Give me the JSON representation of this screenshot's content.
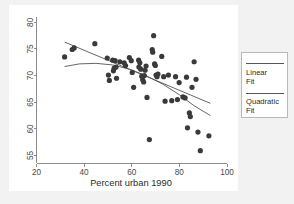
{
  "chart_data": {
    "type": "scatter",
    "title": "",
    "xlabel": "Percent urban 1990",
    "ylabel": "",
    "xlim": [
      20,
      100
    ],
    "ylim": [
      53.5,
      81
    ],
    "xticks": [
      20,
      40,
      60,
      80,
      100
    ],
    "yticks": [
      55,
      60,
      65,
      70,
      75,
      80
    ],
    "grid": false,
    "legend_position": "right-outside",
    "series": [
      {
        "name": "Data points",
        "type": "scatter",
        "marker": "filled-circle",
        "color": "#3a3a3a",
        "points": [
          [
            31.8,
            73.5
          ],
          [
            35.0,
            74.9
          ],
          [
            35.8,
            75.2
          ],
          [
            44.5,
            76.0
          ],
          [
            49.7,
            73.3
          ],
          [
            50.2,
            70.1
          ],
          [
            50.6,
            69.1
          ],
          [
            52.0,
            72.9
          ],
          [
            52.3,
            70.9
          ],
          [
            52.6,
            71.4
          ],
          [
            53.0,
            72.8
          ],
          [
            53.4,
            71.6
          ],
          [
            53.6,
            69.5
          ],
          [
            55.0,
            72.6
          ],
          [
            56.8,
            72.4
          ],
          [
            57.4,
            71.9
          ],
          [
            59.0,
            73.4
          ],
          [
            59.8,
            72.8
          ],
          [
            60.2,
            70.6
          ],
          [
            60.8,
            67.8
          ],
          [
            62.9,
            72.9
          ],
          [
            63.0,
            71.6
          ],
          [
            63.4,
            72.4
          ],
          [
            63.8,
            71.2
          ],
          [
            64.2,
            69.9
          ],
          [
            64.6,
            69.2
          ],
          [
            65.0,
            68.8
          ],
          [
            65.3,
            70.0
          ],
          [
            65.6,
            71.0
          ],
          [
            66.0,
            71.8
          ],
          [
            66.4,
            65.9
          ],
          [
            67.4,
            58.0
          ],
          [
            68.6,
            74.9
          ],
          [
            68.8,
            74.4
          ],
          [
            69.2,
            77.5
          ],
          [
            69.6,
            72.2
          ],
          [
            69.9,
            71.9
          ],
          [
            70.2,
            70.1
          ],
          [
            70.6,
            69.8
          ],
          [
            71.0,
            70.3
          ],
          [
            72.6,
            73.6
          ],
          [
            73.4,
            69.8
          ],
          [
            74.0,
            65.2
          ],
          [
            75.4,
            70.1
          ],
          [
            76.8,
            65.3
          ],
          [
            78.4,
            69.8
          ],
          [
            79.2,
            65.5
          ],
          [
            79.9,
            68.7
          ],
          [
            81.5,
            66.0
          ],
          [
            82.4,
            65.8
          ],
          [
            83.0,
            69.7
          ],
          [
            83.4,
            60.2
          ],
          [
            84.2,
            63.0
          ],
          [
            84.6,
            62.3
          ],
          [
            85.3,
            67.8
          ],
          [
            86.2,
            72.6
          ],
          [
            87.0,
            69.3
          ],
          [
            87.8,
            59.4
          ],
          [
            88.8,
            55.9
          ],
          [
            92.4,
            58.7
          ]
        ]
      },
      {
        "name": "Linear Fit",
        "type": "line",
        "color": "#555555",
        "endpoints": [
          [
            31.8,
            76.3
          ],
          [
            93.0,
            64.8
          ]
        ]
      },
      {
        "name": "Quadratic Fit",
        "type": "line",
        "color": "#555555",
        "curve": [
          [
            31.8,
            71.7
          ],
          [
            38.0,
            72.2
          ],
          [
            45.0,
            72.3
          ],
          [
            52.0,
            72.0
          ],
          [
            59.0,
            71.2
          ],
          [
            66.0,
            70.0
          ],
          [
            73.0,
            68.4
          ],
          [
            80.0,
            66.4
          ],
          [
            86.0,
            64.4
          ],
          [
            93.0,
            62.5
          ]
        ]
      }
    ]
  },
  "axis": {
    "x_title": "Percent urban 1990",
    "x_tick_labels": [
      "20",
      "40",
      "60",
      "80",
      "100"
    ],
    "y_tick_labels": [
      "55",
      "60",
      "65",
      "70",
      "75",
      "80"
    ]
  },
  "legend": {
    "entries": [
      {
        "label": "Linear\nFit",
        "color": "#555555"
      },
      {
        "label": "Quadratic\nFit",
        "color": "#555555"
      }
    ]
  },
  "colors": {
    "background": "#f2f2f2",
    "plot_background": "#ffffff",
    "axis": "#8c8c8c",
    "marker": "#3a3a3a",
    "fit_line": "#555555",
    "legend_border": "#b9b9b9"
  }
}
